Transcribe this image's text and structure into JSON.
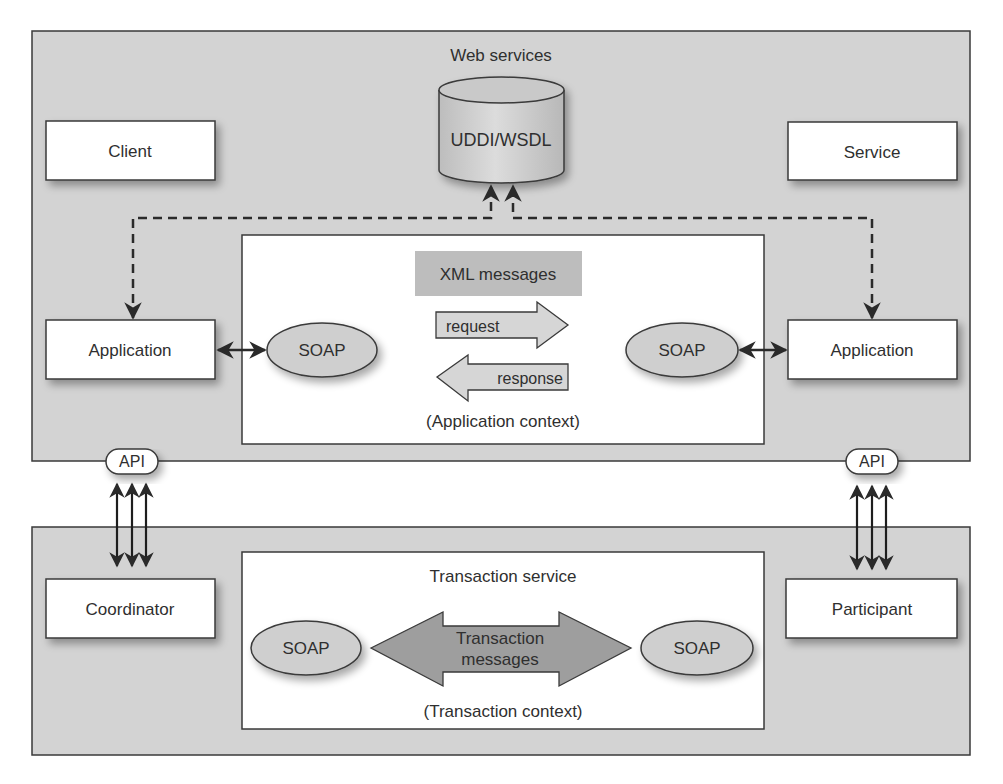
{
  "colors": {
    "panel_fill": "#d3d3d3",
    "inner_fill": "#ffffff",
    "box_fill": "#ffffff",
    "soap_fill": "#cfcfcf",
    "xml_fill": "#bdbdbd",
    "arrow_fill": "#d6d6d6",
    "txn_arrow_fill": "#9e9e9e",
    "stroke": "#3a3a3a"
  },
  "web_services": {
    "title": "Web services",
    "registry": "UDDI/WSDL",
    "client": "Client",
    "service": "Service",
    "left_application": "Application",
    "right_application": "Application",
    "application_context": {
      "xml_label": "XML messages",
      "request_label": "request",
      "response_label": "response",
      "left_soap": "SOAP",
      "right_soap": "SOAP",
      "caption": "(Application context)"
    }
  },
  "api": {
    "left": "API",
    "right": "API"
  },
  "transaction": {
    "coordinator": "Coordinator",
    "participant": "Participant",
    "service_title": "Transaction service",
    "left_soap": "SOAP",
    "right_soap": "SOAP",
    "messages_line1": "Transaction",
    "messages_line2": "messages",
    "caption": "(Transaction context)"
  }
}
